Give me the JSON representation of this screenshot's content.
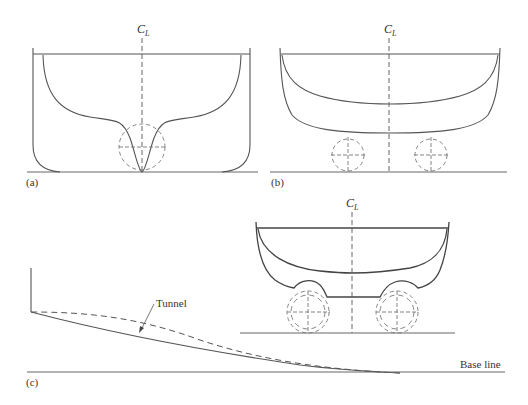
{
  "figure": {
    "panels": [
      {
        "id": "a",
        "label": "(a)",
        "centerline_label": "C",
        "centerline_subscript": "L",
        "description": "Hull section with single central tunnel for one propeller"
      },
      {
        "id": "b",
        "label": "(b)",
        "centerline_label": "C",
        "centerline_subscript": "L",
        "description": "Flat-bottom hull section with two propellers below hull"
      },
      {
        "id": "c",
        "label": "(c)",
        "centerline_label": "C",
        "centerline_subscript": "L",
        "description": "Twin tunnel hull section with tunnel profile along length",
        "annotations": {
          "tunnel": "Tunnel",
          "base_line": "Base line"
        }
      }
    ],
    "colors": {
      "line": "#555555",
      "dashed": "#777777",
      "text": "#333333",
      "background": "#ffffff"
    }
  }
}
